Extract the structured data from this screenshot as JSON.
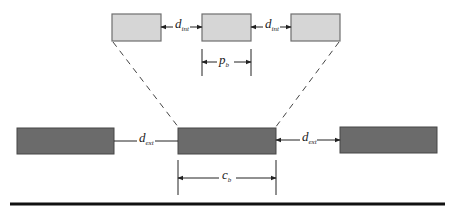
{
  "colors": {
    "light_box_fill": "#d6d6d6",
    "light_box_stroke": "#6e6e6e",
    "dark_box_fill": "#6b6b6b",
    "dark_box_stroke": "#474747",
    "line": "#222222"
  },
  "top_row": {
    "boxes": [
      {
        "id": "top-left"
      },
      {
        "id": "top-middle"
      },
      {
        "id": "top-right"
      }
    ],
    "gap_labels": [
      {
        "main": "d",
        "sub": "int"
      },
      {
        "main": "d",
        "sub": "int"
      }
    ],
    "pitch_label": {
      "main": "p",
      "sub": "b"
    }
  },
  "bottom_row": {
    "boxes": [
      {
        "id": "bottom-left"
      },
      {
        "id": "bottom-center"
      },
      {
        "id": "bottom-right"
      }
    ],
    "gap_labels": [
      {
        "main": "d",
        "sub": "ext"
      },
      {
        "main": "d",
        "sub": "ext"
      }
    ],
    "width_label": {
      "main": "c",
      "sub": "b"
    }
  }
}
